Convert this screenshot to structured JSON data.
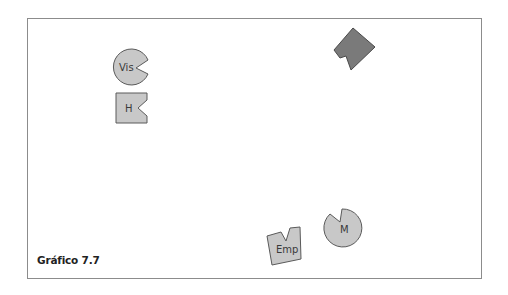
{
  "figure": {
    "caption": "Gráfico 7.7",
    "frame_color": "#8c8c8c",
    "background": "#ffffff"
  },
  "shapes": [
    {
      "id": "vis",
      "type": "circle-notched",
      "label": "Vis",
      "fill": "#c8c8c8",
      "stroke": "#5a5a5a"
    },
    {
      "id": "h",
      "type": "square-notched",
      "label": "H",
      "fill": "#c8c8c8",
      "stroke": "#5a5a5a"
    },
    {
      "id": "dark",
      "type": "diamond-notched",
      "label": "",
      "fill": "#7a7a7a",
      "stroke": "#4a4a4a"
    },
    {
      "id": "emp",
      "type": "square-notched-tilted",
      "label": "Emp",
      "fill": "#c8c8c8",
      "stroke": "#5a5a5a"
    },
    {
      "id": "m",
      "type": "circle-notched",
      "label": "M",
      "fill": "#c8c8c8",
      "stroke": "#5a5a5a"
    }
  ]
}
